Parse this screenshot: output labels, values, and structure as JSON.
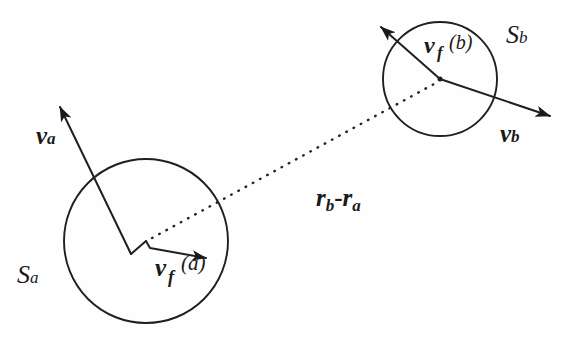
{
  "figure": {
    "kind": "vector-diagram",
    "ink_color": "#1a1a1a",
    "background_color": "#fefefe",
    "width": 577,
    "height": 357
  },
  "labels": {
    "v_a": {
      "base": "v",
      "sub": "a"
    },
    "S_a": {
      "base": "S",
      "sub": "a"
    },
    "v_f_a": {
      "base": "v",
      "sub": "f",
      "arg": "(a)"
    },
    "v_f_b": {
      "base": "v",
      "sub": "f",
      "arg": "(b)"
    },
    "v_b": {
      "base": "v",
      "sub": "b"
    },
    "S_b": {
      "base": "S",
      "sub": "b"
    },
    "r_diff": {
      "first": "r",
      "first_sub": "b",
      "operator": "-",
      "second": "r",
      "second_sub": "a"
    }
  },
  "shapes": {
    "circle_a": {
      "name": "S_a",
      "cx": 146,
      "cy": 241,
      "r": 82
    },
    "circle_b": {
      "name": "S_b",
      "cx": 440,
      "cy": 79,
      "r": 57
    }
  },
  "vectors": [
    {
      "name": "v_a",
      "from": [
        146,
        241
      ],
      "kink": [
        131,
        254
      ],
      "to": [
        58,
        104
      ],
      "style": "solid-arrow"
    },
    {
      "name": "v_f_a",
      "from": [
        146,
        241
      ],
      "kink": [
        150,
        247
      ],
      "to": [
        208,
        258
      ],
      "style": "solid-arrow"
    },
    {
      "name": "r_b-r_a",
      "from": [
        146,
        241
      ],
      "to": [
        436,
        82
      ],
      "style": "dotted-no-arrow"
    },
    {
      "name": "v_f_b",
      "from": [
        440,
        79
      ],
      "to": [
        379,
        25
      ],
      "style": "solid-arrow"
    },
    {
      "name": "v_b",
      "from": [
        440,
        79
      ],
      "to": [
        552,
        117
      ],
      "style": "solid-arrow"
    }
  ]
}
